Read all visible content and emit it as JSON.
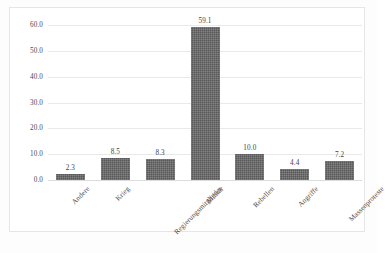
{
  "chart_data": {
    "type": "bar",
    "title": "",
    "subtitle": "",
    "xlabel": "",
    "ylabel": "",
    "categories": [
      "Andere",
      "Krieg",
      "Regierungsmitglieder",
      "Militär",
      "Rebellen",
      "Angriffe",
      "Massenproteste"
    ],
    "values": [
      2.3,
      8.5,
      8.3,
      59.1,
      10.0,
      4.4,
      7.2
    ],
    "value_labels": [
      "2.3",
      "8.5",
      "8.3",
      "59.1",
      "10.0",
      "4.4",
      "7.2"
    ],
    "ylim": [
      0.0,
      60.0
    ],
    "ytick_labels": [
      "0.0",
      "10.0",
      "20.0",
      "30.0",
      "40.0",
      "50.0",
      "60.0"
    ],
    "ytick_values": [
      0,
      10,
      20,
      30,
      40,
      50,
      60
    ],
    "grid": true,
    "grid_axis": "y",
    "legend": false,
    "legend_position": "none",
    "bar_color": "#585858",
    "gridline_color": "#e9e9e9",
    "axis_text_color": "#4a4a4a",
    "background_color": "#ffffff",
    "frame_color": "#e6e6e6",
    "xtick_label_rotation": -45
  }
}
